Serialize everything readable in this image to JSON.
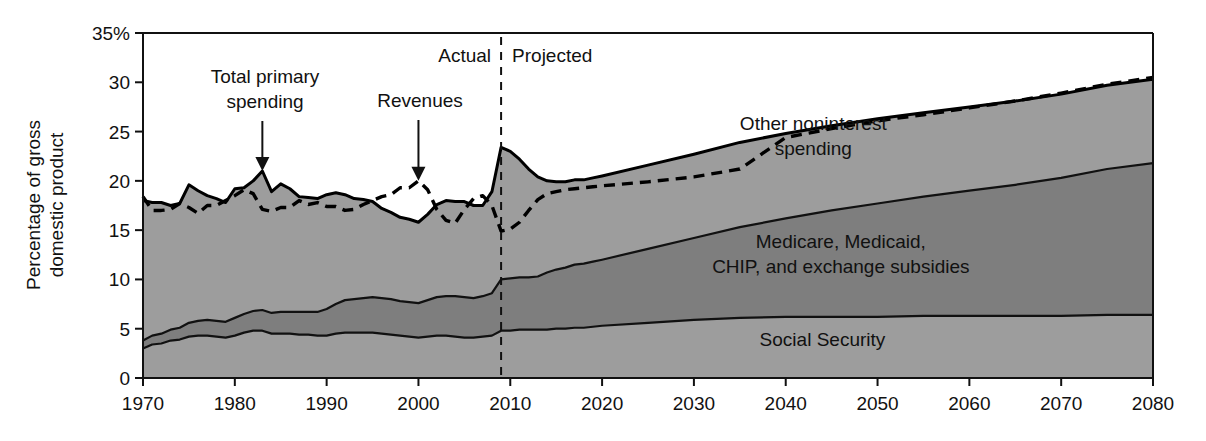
{
  "chart_data": {
    "type": "area",
    "title": "",
    "xlabel": "",
    "ylabel": "Percentage of gross domestic product",
    "xlim": [
      1970,
      2080
    ],
    "ylim": [
      0,
      35
    ],
    "grid": false,
    "legend_position": "inline-labels",
    "y_ticks": [
      "0",
      "5",
      "10",
      "15",
      "20",
      "25",
      "30",
      "35%"
    ],
    "y_tick_values": [
      0,
      5,
      10,
      15,
      20,
      25,
      30,
      35
    ],
    "x_ticks": [
      "1970",
      "1980",
      "1990",
      "2000",
      "2010",
      "2020",
      "2030",
      "2040",
      "2050",
      "2060",
      "2070",
      "2080"
    ],
    "x_tick_values": [
      1970,
      1980,
      1990,
      2000,
      2010,
      2020,
      2030,
      2040,
      2050,
      2060,
      2070,
      2080
    ],
    "divider": {
      "label_left": "Actual",
      "label_right": "Projected",
      "x_value": 2009
    },
    "annotations": [
      {
        "text": "Total primary spending",
        "lines": [
          "Total primary",
          "spending"
        ],
        "points_to_x": 1983,
        "points_to_y": 21.0
      },
      {
        "text": "Revenues",
        "lines": [
          "Revenues"
        ],
        "points_to_x": 2000,
        "points_to_y": 20.0
      }
    ],
    "area_labels": [
      {
        "text": "Other noninterest spending",
        "lines": [
          "Other noninterest",
          "spending"
        ],
        "x_value": 2043,
        "y_value": 25.2
      },
      {
        "text": "Medicare, Medicaid, CHIP, and exchange subsidies",
        "lines": [
          "Medicare, Medicaid,",
          "CHIP, and exchange subsidies"
        ],
        "x_value": 2046,
        "y_value": 13.2
      },
      {
        "text": "Social Security",
        "lines": [
          "Social Security"
        ],
        "x_value": 2044,
        "y_value": 3.2
      }
    ],
    "x": [
      1970,
      1971,
      1972,
      1973,
      1974,
      1975,
      1976,
      1977,
      1978,
      1979,
      1980,
      1981,
      1982,
      1983,
      1984,
      1985,
      1986,
      1987,
      1988,
      1989,
      1990,
      1991,
      1992,
      1993,
      1994,
      1995,
      1996,
      1997,
      1998,
      1999,
      2000,
      2001,
      2002,
      2003,
      2004,
      2005,
      2006,
      2007,
      2008,
      2009,
      2010,
      2011,
      2012,
      2013,
      2014,
      2015,
      2016,
      2017,
      2018,
      2019,
      2020,
      2025,
      2030,
      2035,
      2040,
      2045,
      2050,
      2055,
      2060,
      2065,
      2070,
      2075,
      2080
    ],
    "series": [
      {
        "name": "Social Security",
        "fill": "#9d9d9d",
        "stacked_order": 1,
        "values": [
          3.0,
          3.4,
          3.5,
          3.8,
          3.9,
          4.2,
          4.3,
          4.3,
          4.2,
          4.1,
          4.3,
          4.6,
          4.8,
          4.8,
          4.5,
          4.5,
          4.5,
          4.4,
          4.4,
          4.3,
          4.3,
          4.5,
          4.6,
          4.6,
          4.6,
          4.6,
          4.5,
          4.4,
          4.3,
          4.2,
          4.1,
          4.2,
          4.3,
          4.3,
          4.2,
          4.1,
          4.1,
          4.2,
          4.3,
          4.8,
          4.8,
          4.9,
          4.9,
          4.9,
          4.9,
          5.0,
          5.0,
          5.1,
          5.1,
          5.2,
          5.3,
          5.6,
          5.9,
          6.1,
          6.2,
          6.2,
          6.2,
          6.3,
          6.3,
          6.3,
          6.3,
          6.4,
          6.4
        ]
      },
      {
        "name": "Medicare, Medicaid, CHIP, and exchange subsidies",
        "fill": "#7e7e7e",
        "stacked_order": 2,
        "values": [
          0.8,
          0.9,
          1.0,
          1.1,
          1.2,
          1.4,
          1.5,
          1.6,
          1.6,
          1.6,
          1.8,
          1.9,
          2.0,
          2.1,
          2.1,
          2.2,
          2.2,
          2.3,
          2.3,
          2.4,
          2.7,
          3.0,
          3.3,
          3.4,
          3.5,
          3.6,
          3.6,
          3.6,
          3.5,
          3.5,
          3.5,
          3.7,
          3.9,
          4.0,
          4.1,
          4.1,
          4.0,
          4.1,
          4.3,
          5.2,
          5.3,
          5.3,
          5.3,
          5.4,
          5.8,
          6.0,
          6.2,
          6.4,
          6.5,
          6.6,
          6.7,
          7.5,
          8.3,
          9.2,
          10.0,
          10.8,
          11.5,
          12.1,
          12.7,
          13.3,
          14.0,
          14.8,
          15.4
        ]
      },
      {
        "name": "Other noninterest spending",
        "fill": "#9d9d9d",
        "stacked_order": 3,
        "values": [
          14.2,
          13.5,
          13.3,
          12.6,
          12.6,
          14.0,
          13.2,
          12.6,
          12.4,
          12.1,
          13.1,
          12.8,
          13.2,
          14.1,
          12.3,
          13.0,
          12.5,
          11.7,
          11.6,
          11.5,
          11.6,
          11.3,
          10.7,
          10.2,
          10.0,
          9.7,
          9.1,
          8.8,
          8.5,
          8.4,
          8.2,
          8.7,
          9.4,
          9.7,
          9.6,
          9.7,
          9.4,
          9.2,
          10.3,
          13.4,
          12.9,
          12.0,
          11.0,
          10.1,
          9.3,
          8.9,
          8.7,
          8.6,
          8.5,
          8.5,
          8.5,
          8.5,
          8.5,
          8.6,
          8.6,
          8.6,
          8.6,
          8.5,
          8.5,
          8.5,
          8.5,
          8.5,
          8.5
        ]
      }
    ],
    "lines": [
      {
        "name": "Total primary spending",
        "style": "solid",
        "color": "#000000",
        "values": [
          18.0,
          17.8,
          17.8,
          17.5,
          17.7,
          19.6,
          19.0,
          18.5,
          18.2,
          17.8,
          19.2,
          19.3,
          20.0,
          21.0,
          18.9,
          19.7,
          19.2,
          18.4,
          18.3,
          18.2,
          18.6,
          18.8,
          18.6,
          18.2,
          18.1,
          17.9,
          17.2,
          16.8,
          16.3,
          16.1,
          15.8,
          16.6,
          17.6,
          18.0,
          17.9,
          17.9,
          17.5,
          17.5,
          18.9,
          23.4,
          23.0,
          22.2,
          21.2,
          20.4,
          20.0,
          19.9,
          19.9,
          20.1,
          20.1,
          20.3,
          20.5,
          21.6,
          22.7,
          23.9,
          24.8,
          25.6,
          26.3,
          26.9,
          27.5,
          28.1,
          28.8,
          29.7,
          30.3
        ]
      },
      {
        "name": "Revenues",
        "style": "dashed",
        "color": "#000000",
        "values": [
          18.4,
          17.0,
          17.0,
          17.1,
          17.7,
          17.3,
          16.7,
          17.5,
          17.5,
          18.0,
          18.5,
          19.1,
          18.7,
          17.1,
          16.9,
          17.3,
          17.3,
          18.0,
          17.6,
          17.8,
          17.4,
          17.4,
          17.0,
          17.1,
          17.6,
          18.0,
          18.4,
          18.6,
          19.3,
          19.3,
          20.0,
          19.1,
          17.1,
          16.0,
          15.7,
          17.1,
          18.2,
          18.5,
          17.5,
          14.9,
          15.1,
          15.8,
          17.0,
          18.1,
          18.7,
          18.9,
          19.1,
          19.2,
          19.3,
          19.4,
          19.5,
          19.9,
          20.4,
          21.2,
          24.4,
          25.3,
          26.1,
          26.7,
          27.4,
          28.1,
          28.9,
          29.8,
          30.5
        ]
      }
    ]
  }
}
